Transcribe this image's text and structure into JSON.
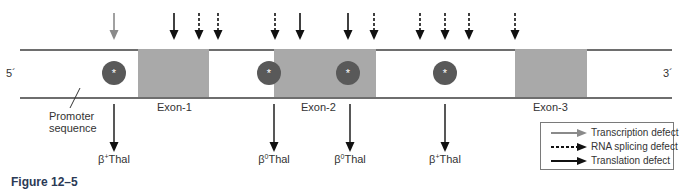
{
  "diagram": {
    "strand": {
      "left_end": "5´",
      "right_end": "3´"
    },
    "exons": [
      {
        "label": "Exon-1",
        "x": 138,
        "width": 71
      },
      {
        "label": "Exon-2",
        "x": 274,
        "width": 102
      },
      {
        "label": "Exon-3",
        "x": 515,
        "width": 72
      }
    ],
    "promoter_label_line1": "Promoter",
    "promoter_label_line2": "sequence",
    "mutation_symbol": "*",
    "mutations": [
      {
        "x": 114,
        "type": "transcription"
      },
      {
        "x": 269,
        "type": "translation"
      },
      {
        "x": 348,
        "type": "translation"
      },
      {
        "x": 445,
        "type": "translation"
      }
    ],
    "top_arrows": [
      {
        "x": 114,
        "type": "transcription"
      },
      {
        "x": 174,
        "type": "translation"
      },
      {
        "x": 199,
        "type": "splicing"
      },
      {
        "x": 218,
        "type": "splicing"
      },
      {
        "x": 275,
        "type": "splicing"
      },
      {
        "x": 300,
        "type": "translation"
      },
      {
        "x": 348,
        "type": "translation"
      },
      {
        "x": 374,
        "type": "splicing"
      },
      {
        "x": 420,
        "type": "splicing"
      },
      {
        "x": 445,
        "type": "splicing"
      },
      {
        "x": 469,
        "type": "splicing"
      },
      {
        "x": 515,
        "type": "splicing"
      }
    ],
    "bottom_outcomes": [
      {
        "x": 114,
        "label_sup": "+",
        "label_main": "Thal",
        "prefix": "β"
      },
      {
        "x": 274,
        "label_sup": "0",
        "label_main": "Thal",
        "prefix": "β"
      },
      {
        "x": 350,
        "label_sup": "0",
        "label_main": "Thal",
        "prefix": "β"
      },
      {
        "x": 445,
        "label_sup": "+",
        "label_main": "Thal",
        "prefix": "β"
      }
    ]
  },
  "legend": {
    "items": [
      {
        "label": "Transcription defect",
        "style": "gray-solid"
      },
      {
        "label": "RNA splicing defect",
        "style": "black-dashed"
      },
      {
        "label": "Translation defect",
        "style": "black-solid"
      }
    ]
  },
  "figure_caption": "Figure 12–5",
  "colors": {
    "exon_fill": "#a9a9a9",
    "mutation_circle": "#595959",
    "transcription_arrow": "#8a8a8a",
    "defect_arrow": "#111111",
    "caption": "#2b3a55"
  }
}
